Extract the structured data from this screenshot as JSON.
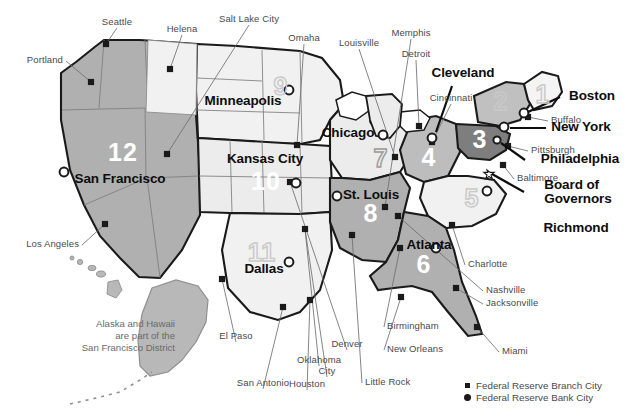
{
  "map": {
    "title": "Federal Reserve Districts",
    "background_color": "#ffffff",
    "note": {
      "line1": "Alaska and Hawaii",
      "line2": "are part of the",
      "line3": "San Francisco District"
    },
    "colors": {
      "district_light": "#f0f0f0",
      "district_mid": "#d8d8d8",
      "district_gray": "#b8b8b8",
      "district_dark": "#8a8a8a",
      "border": "#1a1a1a",
      "state_line": "#8f8f8f",
      "leader_line": "#6f6f6f",
      "label_gray": "#4a4a4a",
      "label_black": "#0d0d0d",
      "numeral_white": "#ffffff",
      "numeral_ghost": "#c9c9c9"
    }
  },
  "districts": [
    {
      "number": "1",
      "bank": "Boston",
      "x": 543,
      "y": 94,
      "style": "ghost"
    },
    {
      "number": "2",
      "bank": "New York",
      "x": 501,
      "y": 101,
      "style": "ghost"
    },
    {
      "number": "3",
      "bank": "Philadelphia",
      "x": 480,
      "y": 139,
      "style": "solid"
    },
    {
      "number": "4",
      "bank": "Cleveland",
      "x": 429,
      "y": 157,
      "style": "solid"
    },
    {
      "number": "5",
      "bank": "Richmond",
      "x": 472,
      "y": 198,
      "style": "ghost"
    },
    {
      "number": "6",
      "bank": "Atlanta",
      "x": 424,
      "y": 264,
      "style": "solid"
    },
    {
      "number": "7",
      "bank": "Chicago",
      "x": 381,
      "y": 158,
      "style": "ghost-dk"
    },
    {
      "number": "8",
      "bank": "St. Louis",
      "x": 371,
      "y": 213,
      "style": "solid"
    },
    {
      "number": "9",
      "bank": "Minneapolis",
      "x": 281,
      "y": 86,
      "style": "ghost"
    },
    {
      "number": "10",
      "bank": "Kansas City",
      "x": 266,
      "y": 181,
      "style": "solid"
    },
    {
      "number": "11",
      "bank": "Dallas",
      "x": 262,
      "y": 252,
      "style": "ghost"
    },
    {
      "number": "12",
      "bank": "San Francisco",
      "x": 123,
      "y": 152,
      "style": "solid"
    }
  ],
  "bank_cities": [
    {
      "label": "Minneapolis",
      "x": 243,
      "y": 102,
      "align": "center",
      "size": "lg"
    },
    {
      "label": "Chicago",
      "x": 348,
      "y": 134,
      "align": "center",
      "size": "lg"
    },
    {
      "label": "Cleveland",
      "x": 463,
      "y": 74,
      "align": "center",
      "size": "lg"
    },
    {
      "label": "Boston",
      "x": 592,
      "y": 97,
      "align": "center",
      "size": "lg"
    },
    {
      "label": "New York",
      "x": 581,
      "y": 128,
      "align": "center",
      "size": "lg"
    },
    {
      "label": "Philadelphia",
      "x": 580,
      "y": 160,
      "align": "center",
      "size": "lg"
    },
    {
      "label": "Richmond",
      "x": 576,
      "y": 229,
      "align": "center",
      "size": "lg"
    },
    {
      "label": "Atlanta",
      "x": 429,
      "y": 246,
      "align": "center",
      "size": "lg"
    },
    {
      "label": "St. Louis",
      "x": 371,
      "y": 196,
      "align": "center",
      "size": "lg"
    },
    {
      "label": "Kansas City",
      "x": 265,
      "y": 160,
      "align": "center",
      "size": "lg"
    },
    {
      "label": "Dallas",
      "x": 264,
      "y": 270,
      "align": "center",
      "size": "lg"
    },
    {
      "label": "San Francisco",
      "x": 120,
      "y": 180,
      "align": "center",
      "size": "lg"
    }
  ],
  "board_of_governors": {
    "line1": "Board of",
    "line2": "Governors",
    "x": 578,
    "y": 186
  },
  "branch_cities": [
    {
      "label": "Portland",
      "lx": 63,
      "ly": 55,
      "align": "right",
      "px": 91,
      "py": 82
    },
    {
      "label": "Seattle",
      "lx": 117,
      "ly": 17,
      "align": "center",
      "px": 106,
      "py": 44
    },
    {
      "label": "Helena",
      "lx": 182,
      "ly": 24,
      "align": "center",
      "px": 170,
      "py": 69
    },
    {
      "label": "Salt Lake City",
      "lx": 249,
      "ly": 14,
      "align": "center",
      "px": 167,
      "py": 154
    },
    {
      "label": "Omaha",
      "lx": 304,
      "ly": 33,
      "align": "center",
      "px": 297,
      "py": 145
    },
    {
      "label": "Louisville",
      "lx": 359,
      "ly": 38,
      "align": "center",
      "px": 395,
      "py": 157
    },
    {
      "label": "Memphis",
      "lx": 411,
      "ly": 28,
      "align": "center",
      "px": 385,
      "py": 207
    },
    {
      "label": "Detroit",
      "lx": 416,
      "ly": 49,
      "align": "center",
      "px": 419,
      "py": 126
    },
    {
      "label": "Cincinnati",
      "lx": 451,
      "ly": 93,
      "align": "center",
      "px": 432,
      "py": 142
    },
    {
      "label": "Buffalo",
      "lx": 551,
      "ly": 115,
      "align": "left",
      "px": 528,
      "py": 117
    },
    {
      "label": "Pittsburgh",
      "lx": 531,
      "ly": 145,
      "align": "left",
      "px": 508,
      "py": 146
    },
    {
      "label": "Baltimore",
      "lx": 517,
      "ly": 173,
      "align": "left",
      "px": 503,
      "py": 165
    },
    {
      "label": "Charlotte",
      "lx": 468,
      "ly": 259,
      "align": "left",
      "px": 452,
      "py": 225
    },
    {
      "label": "Nashville",
      "lx": 486,
      "ly": 285,
      "align": "left",
      "px": 398,
      "py": 216
    },
    {
      "label": "Jacksonville",
      "lx": 486,
      "ly": 298,
      "align": "left",
      "px": 456,
      "py": 288
    },
    {
      "label": "Miami",
      "lx": 502,
      "ly": 346,
      "align": "left",
      "px": 477,
      "py": 327
    },
    {
      "label": "Birmingham",
      "lx": 387,
      "ly": 321,
      "align": "left",
      "px": 400,
      "py": 248
    },
    {
      "label": "New Orleans",
      "lx": 387,
      "ly": 344,
      "align": "left",
      "px": 401,
      "py": 297
    },
    {
      "label": "Little Rock",
      "lx": 365,
      "ly": 377,
      "align": "left",
      "px": 352,
      "py": 235
    },
    {
      "label": "Houston",
      "lx": 307,
      "ly": 379,
      "align": "center",
      "px": 310,
      "py": 300
    },
    {
      "label": "Oklahoma",
      "lx": 319,
      "ly": 355,
      "align": "center",
      "px": 305,
      "py": 229
    },
    {
      "label": "City",
      "lx": 327,
      "ly": 366,
      "align": "center",
      "px": 305,
      "py": 229
    },
    {
      "label": "Denver",
      "lx": 347,
      "ly": 339,
      "align": "center",
      "px": 290,
      "py": 182
    },
    {
      "label": "San Antonio",
      "lx": 263,
      "ly": 378,
      "align": "center",
      "px": 283,
      "py": 307
    },
    {
      "label": "El Paso",
      "lx": 236,
      "ly": 331,
      "align": "center",
      "px": 222,
      "py": 279
    },
    {
      "label": "Los Angeles",
      "lx": 79,
      "ly": 239,
      "align": "right",
      "px": 105,
      "py": 224
    }
  ],
  "legend": {
    "items": [
      {
        "marker": "square-marker",
        "label": "Federal Reserve Branch City"
      },
      {
        "marker": "circle-marker",
        "label": "Federal Reserve Bank City"
      }
    ]
  }
}
